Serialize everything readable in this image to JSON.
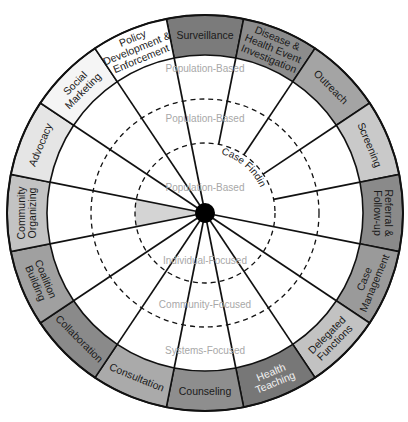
{
  "diagram": {
    "type": "wheel",
    "center": {
      "x": 205,
      "y": 213
    },
    "radii": {
      "outer": 198,
      "band_inner": 158,
      "outer_dashed": 114,
      "inner_dashed": 70,
      "hub": 10
    },
    "segments": [
      {
        "label": [
          "Surveillance"
        ],
        "fill": "#7b7b7b",
        "light": false
      },
      {
        "label": [
          "Disease &",
          "Health Event",
          "Investigation"
        ],
        "fill": "#8c8c8c",
        "light": false
      },
      {
        "label": [
          "Outreach"
        ],
        "fill": "#a4a4a4",
        "light": false
      },
      {
        "label": [
          "Screening"
        ],
        "fill": "#c9c9c9",
        "light": false
      },
      {
        "label": [
          "Referral &",
          "Follow-up"
        ],
        "fill": "#8a8a8a",
        "light": false
      },
      {
        "label": [
          "Case",
          "Management"
        ],
        "fill": "#9a9a9a",
        "light": false
      },
      {
        "label": [
          "Delegated",
          "Functions"
        ],
        "fill": "#c2c2c2",
        "light": false
      },
      {
        "label": [
          "Health",
          "Teaching"
        ],
        "fill": "#777777",
        "light": true
      },
      {
        "label": [
          "Counseling"
        ],
        "fill": "#8e8e8e",
        "light": false
      },
      {
        "label": [
          "Consultation"
        ],
        "fill": "#aaaaaa",
        "light": false
      },
      {
        "label": [
          "Collaboration"
        ],
        "fill": "#8a8a8a",
        "light": false
      },
      {
        "label": [
          "Coalition",
          "Building"
        ],
        "fill": "#a0a0a0",
        "light": false
      },
      {
        "label": [
          "Community",
          "Organizing"
        ],
        "fill": "#c3c3c3",
        "light": false
      },
      {
        "label": [
          "Advocacy"
        ],
        "fill": "#e5e5e5",
        "light": false
      },
      {
        "label": [
          "Social",
          "Marketing"
        ],
        "fill": "#f5f5f5",
        "light": false
      },
      {
        "label": [
          "Policy",
          "Development &",
          "Enforcement"
        ],
        "fill": "#ffffff",
        "light": false
      }
    ],
    "level_labels": {
      "outer_population": "Population-Based",
      "middle_population": "Population-Based",
      "inner_population": "Population-Based",
      "individual": "Individual-Focused",
      "community": "Community-Focused",
      "systems": "Systems-Focused"
    },
    "case_finding_label": "Case Finding",
    "highlight_wedge_fill": "#d4d4d4",
    "colors": {
      "stroke": "#111111",
      "hub": "#000000",
      "level_text": "#a8a8a8"
    }
  }
}
